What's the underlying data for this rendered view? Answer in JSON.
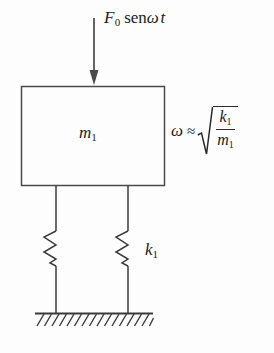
{
  "figure": {
    "background_color": "#fdfdfd",
    "line_color": "#4a4a4a",
    "text_color": "#1c1c1c"
  },
  "force": {
    "symbol": "F",
    "subscript": "0",
    "function": "sen",
    "omega": "ω",
    "time": "t",
    "full_label": "F0 senωt",
    "arrow": "down-arrow"
  },
  "mass": {
    "symbol": "m",
    "subscript": "1",
    "full_label": "m1"
  },
  "spring": {
    "symbol": "k",
    "subscript": "1",
    "full_label": "k1",
    "count": 2
  },
  "formula": {
    "omega": "ω",
    "relation": "≈",
    "radical": "√",
    "numerator": "k",
    "numerator_sub": "1",
    "denominator": "m",
    "denominator_sub": "1",
    "full_label": "ω ≈ √(k1/m1)"
  },
  "ground": {
    "hatch_count": 16,
    "label": "fixed-ground-support"
  }
}
